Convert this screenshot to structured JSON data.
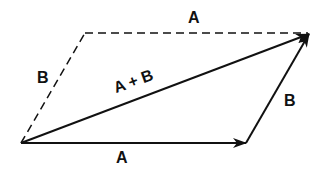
{
  "colors": {
    "ink": "#111111",
    "background": "#ffffff"
  },
  "labels": {
    "top_a": "A",
    "left_b": "B",
    "sum": "A + B",
    "right_b": "B",
    "bottom_a": "A"
  },
  "vectors": [
    {
      "name": "A",
      "style": "solid",
      "from": [
        21,
        143
      ],
      "to": [
        246,
        143
      ],
      "arrow": true
    },
    {
      "name": "B",
      "style": "solid",
      "from": [
        246,
        143
      ],
      "to": [
        310,
        33
      ],
      "arrow": true
    },
    {
      "name": "A + B",
      "style": "solid",
      "from": [
        21,
        143
      ],
      "to": [
        310,
        33
      ],
      "arrow": true
    },
    {
      "name": "B (dashed)",
      "style": "dashed",
      "from": [
        21,
        143
      ],
      "to": [
        85,
        33
      ],
      "arrow": false
    },
    {
      "name": "A (dashed)",
      "style": "dashed",
      "from": [
        85,
        33
      ],
      "to": [
        310,
        33
      ],
      "arrow": false
    }
  ]
}
